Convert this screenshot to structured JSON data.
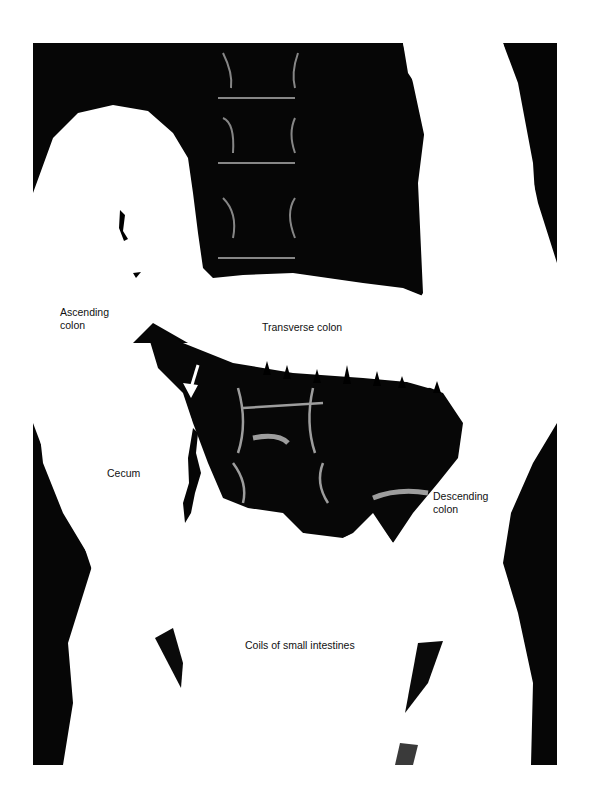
{
  "figure": {
    "type": "radiograph",
    "colors": {
      "background": "#000000",
      "barium": "#ffffff",
      "bone_highlight": "#d8d8d8",
      "label_text": "#111111"
    }
  },
  "labels": [
    {
      "id": "ascending-colon",
      "text": "Ascending\ncolon",
      "x": 60,
      "y": 306
    },
    {
      "id": "transverse-colon",
      "text": "Transverse colon",
      "x": 262,
      "y": 321
    },
    {
      "id": "cecum",
      "text": "Cecum",
      "x": 107,
      "y": 467
    },
    {
      "id": "descending-colon",
      "text": "Descending\ncolon",
      "x": 433,
      "y": 490
    },
    {
      "id": "small-intestines",
      "text": "Coils of small intestines",
      "x": 245,
      "y": 639
    }
  ],
  "annotations": [
    {
      "id": "arrow",
      "type": "white-arrow",
      "points_to": "ileocecal valve region",
      "x": 193,
      "y": 395
    }
  ]
}
